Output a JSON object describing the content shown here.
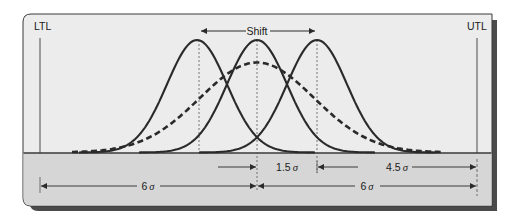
{
  "diagram": {
    "labels": {
      "ltl": "LTL",
      "utl": "UTL",
      "shift": "Shift"
    },
    "dimensions": {
      "shift_amount": {
        "value": "1.5",
        "unit": "σ"
      },
      "remaining_to_utl": {
        "value": "4.5",
        "unit": "σ"
      },
      "ltl_to_center": {
        "value": "6",
        "unit": "σ"
      },
      "center_to_utl": {
        "value": "6",
        "unit": "σ"
      }
    },
    "curves": [
      {
        "name": "shifted-left distribution",
        "style": "solid",
        "mean_offset_sigma": -1.5
      },
      {
        "name": "centered distribution",
        "style": "solid",
        "mean_offset_sigma": 0
      },
      {
        "name": "shifted-right distribution",
        "style": "solid",
        "mean_offset_sigma": 1.5
      },
      {
        "name": "long-term combined distribution",
        "style": "dashed",
        "mean_offset_sigma": 0
      }
    ],
    "colors": {
      "panel_bg": "#ececec",
      "band_bg": "#d6d6d6",
      "line": "#2a2a2a",
      "shadow": "#4a4a4a"
    }
  }
}
